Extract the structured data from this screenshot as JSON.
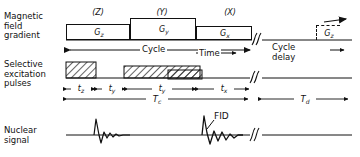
{
  "figure": {
    "type": "nmr-pulse-sequence-timing-diagram",
    "rows": [
      {
        "id": "magnetic-field-gradient",
        "label_lines": [
          "Magnetic",
          "field",
          "gradient"
        ],
        "axis_labels": [
          "(Z)",
          "(Y)",
          "(X)"
        ],
        "pulses": [
          {
            "name": "Gz",
            "base": "G",
            "sub": "z"
          },
          {
            "name": "Gy",
            "base": "G",
            "sub": "y"
          },
          {
            "name": "Gx",
            "base": "G",
            "sub": "x"
          }
        ],
        "repeat_pulse": {
          "name": "Gz",
          "base": "G",
          "sub": "z",
          "style": "dashed"
        }
      },
      {
        "id": "selective-excitation-pulses",
        "label_lines": [
          "Selective",
          "excitation",
          "pulses"
        ],
        "pulses": [
          "pulse-z",
          "pulse-y",
          "pulse-x"
        ]
      },
      {
        "id": "nuclear-signal",
        "label_lines": [
          "Nuclear",
          "signal"
        ],
        "annotation": "FID"
      }
    ],
    "timeline": {
      "cycle_label": "Cycle",
      "time_label": "Time",
      "cycle_delay_lines": [
        "Cycle",
        "delay"
      ],
      "break_symbol": "//"
    },
    "intervals": [
      {
        "base": "t",
        "sub": "z"
      },
      {
        "base": "t",
        "sub": "y"
      },
      {
        "base": "t",
        "sub": "y"
      },
      {
        "base": "t",
        "sub": "x"
      }
    ],
    "totals": [
      {
        "base": "T",
        "sub": "c"
      },
      {
        "base": "T",
        "sub": "d"
      }
    ],
    "colors": {
      "ink": "#111111",
      "paper": "#ffffff"
    }
  }
}
